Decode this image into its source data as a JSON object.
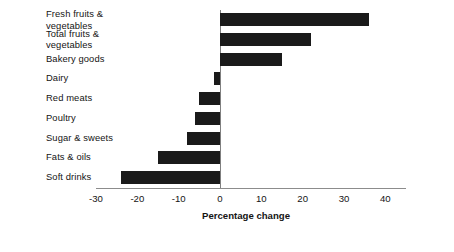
{
  "chart_data": {
    "type": "bar",
    "orientation": "horizontal",
    "title": "",
    "xlabel": "Percentage change",
    "ylabel": "",
    "xlim": [
      -30,
      45
    ],
    "grid": false,
    "legend": null,
    "xticks": [
      -30,
      -20,
      -10,
      0,
      10,
      20,
      30,
      40
    ],
    "xtick_labels": [
      "-30",
      "-20",
      "-10",
      "0",
      "10",
      "20",
      "30",
      "40"
    ],
    "categories": [
      "Fresh fruits &\nvegetables",
      "Total fruits &\nvegetables",
      "Bakery goods",
      "Dairy",
      "Red meats",
      "Poultry",
      "Sugar & sweets",
      "Fats & oils",
      "Soft drinks"
    ],
    "values": [
      36,
      22,
      15,
      -1.5,
      -5,
      -6,
      -8,
      -15,
      -24
    ],
    "bar_color": "#1a1a1a",
    "axis_color": "#7f7f7f"
  }
}
